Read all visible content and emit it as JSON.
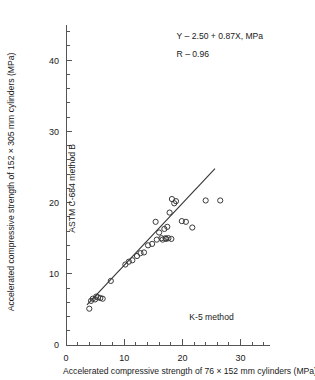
{
  "chart_data": {
    "type": "scatter",
    "title": "",
    "xlabel": "Accelerated compressive strength of 76 × 152 mm cylinders (MPa)",
    "ylabel": "Accelerated compressive strength of 152 × 305 mm cylinders (MPa)",
    "xlim": [
      0,
      35
    ],
    "ylim": [
      0,
      45
    ],
    "xticks": [
      0,
      10,
      20,
      30
    ],
    "yticks": [
      0,
      10,
      20,
      30,
      40
    ],
    "xtick_labels": [
      "0",
      "10",
      "20",
      "30"
    ],
    "ytick_labels": [
      "0",
      "10",
      "20",
      "30",
      "40"
    ],
    "xtick_minor_step": 2,
    "ytick_minor_step": 2,
    "grid": false,
    "legend": false,
    "marker": "open-circle",
    "marker_color": "#3a3a3a",
    "line_color": "#333333",
    "annotations": [
      {
        "name": "regression-equation",
        "text": "Y – 2.50 + 0.87X, MPa",
        "x": 19.0,
        "y": 43.0
      },
      {
        "name": "correlation-coefficient",
        "text": "R – 0.96",
        "x": 19.0,
        "y": 40.5
      },
      {
        "name": "x-method-label",
        "text": "K-5 method",
        "x": 25.0,
        "y": 3.5
      },
      {
        "name": "y-method-label",
        "text": "ASTM C-684 method B",
        "x": 1.6,
        "y": 22.0
      }
    ],
    "fit": {
      "name": "regression-line",
      "slope": 0.87,
      "intercept": 2.5,
      "x_start": 3.6,
      "x_end": 25.6
    },
    "points": [
      {
        "x": 4.0,
        "y": 5.1
      },
      {
        "x": 4.3,
        "y": 6.2
      },
      {
        "x": 4.6,
        "y": 6.5
      },
      {
        "x": 5.0,
        "y": 6.4
      },
      {
        "x": 5.2,
        "y": 6.8
      },
      {
        "x": 5.5,
        "y": 6.7
      },
      {
        "x": 5.9,
        "y": 6.6
      },
      {
        "x": 6.3,
        "y": 6.5
      },
      {
        "x": 7.7,
        "y": 9.0
      },
      {
        "x": 10.2,
        "y": 11.3
      },
      {
        "x": 10.8,
        "y": 11.7
      },
      {
        "x": 11.4,
        "y": 11.9
      },
      {
        "x": 12.2,
        "y": 12.5
      },
      {
        "x": 12.8,
        "y": 12.9
      },
      {
        "x": 13.4,
        "y": 13.0
      },
      {
        "x": 14.1,
        "y": 14.0
      },
      {
        "x": 14.8,
        "y": 14.2
      },
      {
        "x": 15.6,
        "y": 14.8
      },
      {
        "x": 16.0,
        "y": 15.8
      },
      {
        "x": 16.4,
        "y": 15.0
      },
      {
        "x": 16.6,
        "y": 14.8
      },
      {
        "x": 16.9,
        "y": 16.3
      },
      {
        "x": 17.1,
        "y": 15.0
      },
      {
        "x": 17.2,
        "y": 14.9
      },
      {
        "x": 17.4,
        "y": 16.6
      },
      {
        "x": 17.6,
        "y": 15.0
      },
      {
        "x": 17.8,
        "y": 18.6
      },
      {
        "x": 18.1,
        "y": 14.9
      },
      {
        "x": 18.2,
        "y": 20.5
      },
      {
        "x": 18.6,
        "y": 19.9
      },
      {
        "x": 18.9,
        "y": 20.2
      },
      {
        "x": 15.4,
        "y": 17.3
      },
      {
        "x": 19.9,
        "y": 17.4
      },
      {
        "x": 20.6,
        "y": 17.3
      },
      {
        "x": 21.7,
        "y": 16.5
      },
      {
        "x": 24.0,
        "y": 20.3
      },
      {
        "x": 26.5,
        "y": 20.3
      }
    ]
  }
}
